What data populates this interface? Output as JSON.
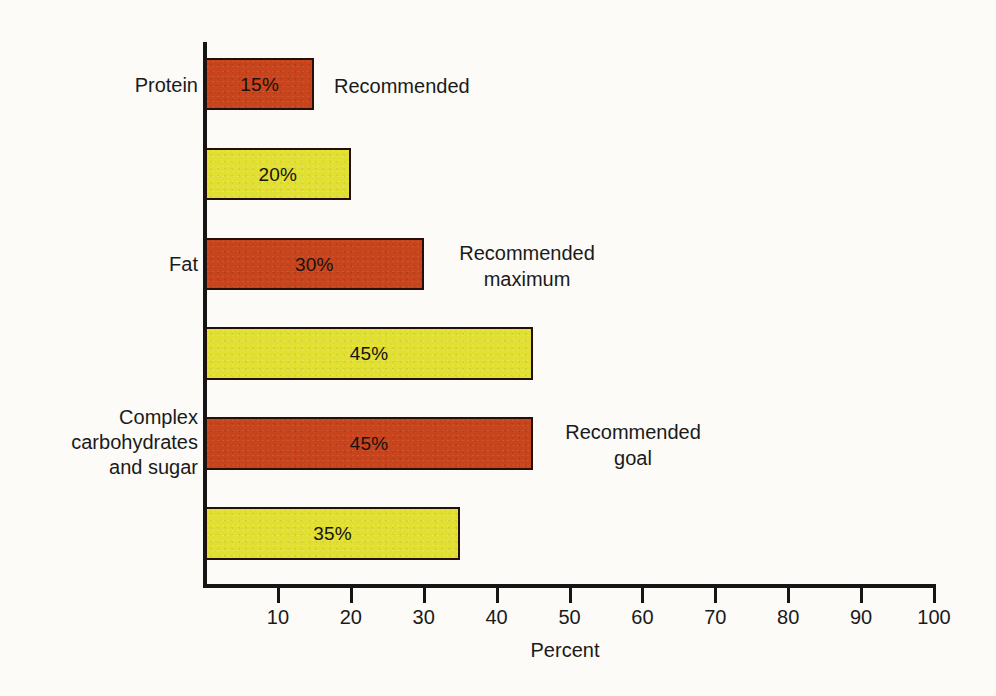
{
  "chart_data": {
    "type": "bar",
    "orientation": "horizontal",
    "title": "",
    "xlabel": "Percent",
    "ylabel": "",
    "xlim": [
      0,
      100
    ],
    "xticks": [
      10,
      20,
      30,
      40,
      50,
      60,
      70,
      80,
      90,
      100
    ],
    "xtick_labels": [
      "10",
      "20",
      "30",
      "40",
      "50",
      "60",
      "70",
      "80",
      "90",
      "100"
    ],
    "grid": false,
    "legend": "none",
    "categories": [
      "Protein",
      "Fat",
      "Complex\ncarbohydrates\nand sugar"
    ],
    "series": [
      {
        "name": "Recommended",
        "color": "#c8441c",
        "values": [
          15,
          30,
          45
        ],
        "value_labels": [
          "15%",
          "30%",
          "45%"
        ]
      },
      {
        "name": "Actual",
        "color": "#e2df33",
        "values": [
          20,
          45,
          35
        ],
        "value_labels": [
          "20%",
          "45%",
          "35%"
        ]
      }
    ],
    "bars": [
      {
        "id": "protein-recommended",
        "category": "Protein",
        "value": 15,
        "label": "15%",
        "color_key": "red",
        "top": 58,
        "height": 52
      },
      {
        "id": "protein-actual",
        "category": "Protein",
        "value": 20,
        "label": "20%",
        "color_key": "yellow",
        "top": 148,
        "height": 52
      },
      {
        "id": "fat-recommended-max",
        "category": "Fat",
        "value": 30,
        "label": "30%",
        "color_key": "red",
        "top": 238,
        "height": 52
      },
      {
        "id": "fat-actual",
        "category": "Fat",
        "value": 45,
        "label": "45%",
        "color_key": "yellow",
        "top": 327,
        "height": 53
      },
      {
        "id": "carbs-recommended-goal",
        "category": "Complex carbohydrates and sugar",
        "value": 45,
        "label": "45%",
        "color_key": "red",
        "top": 417,
        "height": 53
      },
      {
        "id": "carbs-actual",
        "category": "Complex carbohydrates and sugar",
        "value": 35,
        "label": "35%",
        "color_key": "yellow",
        "top": 507,
        "height": 53
      }
    ],
    "annotations": [
      {
        "id": "annot-recommended",
        "text": "Recommended",
        "bar": "protein-recommended"
      },
      {
        "id": "annot-recommended-maximum",
        "text": "Recommended\nmaximum",
        "bar": "fat-recommended-max"
      },
      {
        "id": "annot-recommended-goal",
        "text": "Recommended\ngoal",
        "bar": "carbs-recommended-goal"
      }
    ]
  },
  "labels": {
    "protein": "Protein",
    "fat": "Fat",
    "carbohydrates": "Complex\ncarbohydrates\nand sugar"
  },
  "values": {
    "protein_recommended": "15%",
    "protein_actual": "20%",
    "fat_recommended": "30%",
    "fat_actual": "45%",
    "carbs_recommended": "45%",
    "carbs_actual": "35%"
  },
  "annotations": {
    "recommended": "Recommended",
    "recommended_maximum": "Recommended\nmaximum",
    "recommended_goal": "Recommended\ngoal"
  },
  "axis": {
    "title": "Percent",
    "ticks": [
      "10",
      "20",
      "30",
      "40",
      "50",
      "60",
      "70",
      "80",
      "90",
      "100"
    ]
  },
  "colors": {
    "recommended_bar": "#c8441c",
    "actual_bar": "#e2df33",
    "bar_outline": "#241008",
    "axis": "#151515",
    "text": "#1a1a1a",
    "background": "#fcfbf8"
  }
}
